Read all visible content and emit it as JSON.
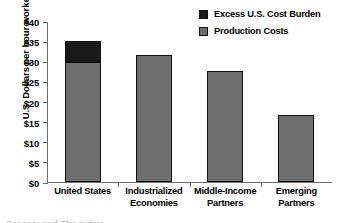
{
  "chart_data": {
    "type": "bar",
    "stacked": true,
    "title": "",
    "xlabel": "",
    "ylabel": "U.S. Dollars per hour worked",
    "ylim": [
      0,
      40
    ],
    "ytick_values": [
      0,
      5,
      10,
      15,
      20,
      25,
      30,
      35,
      40
    ],
    "ytick_labels": [
      "$0",
      "$5",
      "$10",
      "$15",
      "$20",
      "$25",
      "$30",
      "$35",
      "$40"
    ],
    "grid": false,
    "legend_position": "top-right",
    "categories": [
      "United States",
      "Industrialized Economies",
      "Middle-Income Partners",
      "Emerging Partners"
    ],
    "series": [
      {
        "name": "Production Costs",
        "color": "#6e6e6e",
        "values": [
          29.7,
          31.5,
          27.5,
          16.7
        ]
      },
      {
        "name": "Excess U.S. Cost Burden",
        "color": "#1a1a1a",
        "values": [
          5.3,
          0,
          0,
          0
        ]
      }
    ],
    "totals": [
      35.0,
      31.5,
      27.5,
      16.7
    ]
  },
  "axis": {
    "y_title": "U.S. Dollars per hour worked",
    "y_ticks": [
      "$40",
      "$35",
      "$30",
      "$25",
      "$20",
      "$15",
      "$10",
      "$5",
      "$0"
    ]
  },
  "categories": [
    {
      "line1": "United States",
      "line2": ""
    },
    {
      "line1": "Industrialized",
      "line2": "Economies"
    },
    {
      "line1": "Middle-Income",
      "line2": "Partners"
    },
    {
      "line1": "Emerging",
      "line2": "Partners"
    }
  ],
  "legend": {
    "items": [
      {
        "label": "Excess U.S. Cost Burden",
        "color": "#1a1a1a"
      },
      {
        "label": "Production Costs",
        "color": "#6e6e6e"
      }
    ]
  },
  "footer": {
    "artifact_text": "Source: and The Index"
  }
}
